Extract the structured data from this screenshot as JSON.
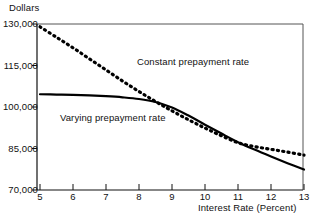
{
  "chart_data": {
    "type": "line",
    "title": "",
    "xlabel": "Interest Rate (Percent)",
    "ylabel": "Dollars",
    "xlim": [
      5,
      13
    ],
    "ylim": [
      70000,
      130000
    ],
    "grid": false,
    "legend_position": "inline-annotation",
    "xticks": [
      "5",
      "6",
      "7",
      "8",
      "9",
      "10",
      "11",
      "12",
      "13"
    ],
    "yticks": [
      "70,000",
      "85,000",
      "100,000",
      "115,000",
      "130,000"
    ],
    "x": [
      5,
      5.5,
      6,
      6.5,
      7,
      7.5,
      8,
      8.5,
      9,
      9.5,
      10,
      10.5,
      11,
      11.5,
      12,
      12.5,
      13
    ],
    "series": [
      {
        "name": "Constant prepayment rate",
        "style": "dotted",
        "color": "#000000",
        "values": [
          129000,
          125200,
          121400,
          117400,
          113400,
          109400,
          105600,
          102000,
          98600,
          95400,
          92400,
          89600,
          87100,
          85700,
          84700,
          83700,
          82600
        ]
      },
      {
        "name": "Varying prepayment rate",
        "style": "solid",
        "color": "#000000",
        "values": [
          104600,
          104500,
          104400,
          104200,
          103900,
          103500,
          102900,
          101800,
          99800,
          96900,
          93600,
          90400,
          87300,
          84600,
          82100,
          79700,
          77400
        ]
      }
    ],
    "annotations": [
      {
        "text": "Constant prepayment rate",
        "x": 8.2,
        "y": 115500
      },
      {
        "text": "Varying prepayment rate",
        "x": 5.7,
        "y": 96500
      }
    ]
  }
}
